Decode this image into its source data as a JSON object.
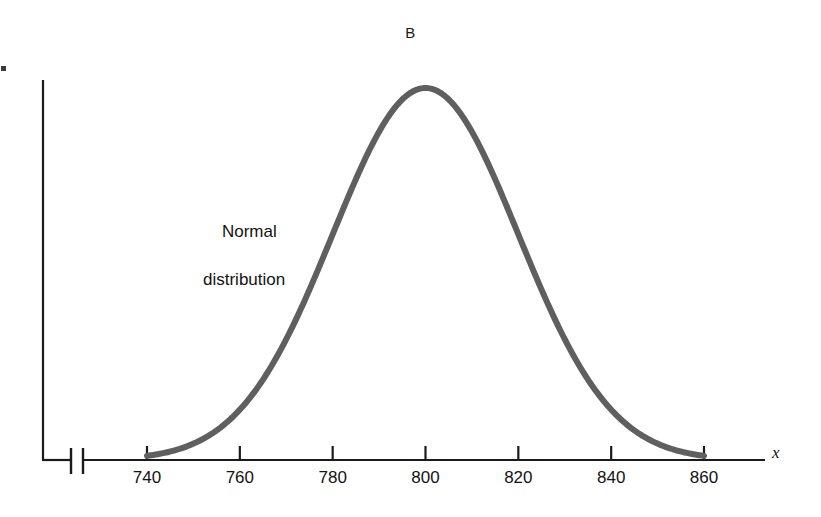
{
  "figure": {
    "panel_letter": "B",
    "background_color": "#ffffff"
  },
  "annotation": {
    "line1": "Normal",
    "line2": "distribution",
    "color": "#131313"
  },
  "axes": {
    "x_variable_label": "x",
    "x_tick_labels": [
      "740",
      "760",
      "780",
      "800",
      "820",
      "840",
      "860"
    ],
    "axis_color": "#1a1a1a",
    "has_axis_break": true,
    "y_axis_visible": true,
    "y_ticks_visible": false
  },
  "curve": {
    "color": "#5f5f5f",
    "width_px": 6
  },
  "chart_data": {
    "type": "line",
    "title": "B",
    "xlabel": "x",
    "ylabel": "",
    "grid": false,
    "legend": null,
    "annotations": [
      {
        "text": "Normal distribution",
        "x": 770,
        "y": 0.52
      }
    ],
    "xlim": [
      733,
      872
    ],
    "ylim": [
      0,
      1.06
    ],
    "xticks": [
      740,
      760,
      780,
      800,
      820,
      840,
      860
    ],
    "xticklabels": [
      "740",
      "760",
      "780",
      "800",
      "820",
      "840",
      "860"
    ],
    "yticks": [],
    "yticklabels": [],
    "axis_break_x": true,
    "series": [
      {
        "name": "Normal distribution",
        "distribution": "normal",
        "mean": 800,
        "std": 20,
        "peak_value": 1.0,
        "x": [
          740,
          745,
          750,
          755,
          760,
          765,
          770,
          775,
          780,
          785,
          790,
          795,
          800,
          805,
          810,
          815,
          820,
          825,
          830,
          835,
          840,
          845,
          850,
          855,
          860
        ],
        "y": [
          0.011,
          0.022,
          0.044,
          0.079,
          0.135,
          0.217,
          0.325,
          0.458,
          0.607,
          0.754,
          0.882,
          0.969,
          1.0,
          0.969,
          0.882,
          0.754,
          0.607,
          0.458,
          0.325,
          0.217,
          0.135,
          0.079,
          0.044,
          0.022,
          0.011
        ]
      }
    ]
  }
}
